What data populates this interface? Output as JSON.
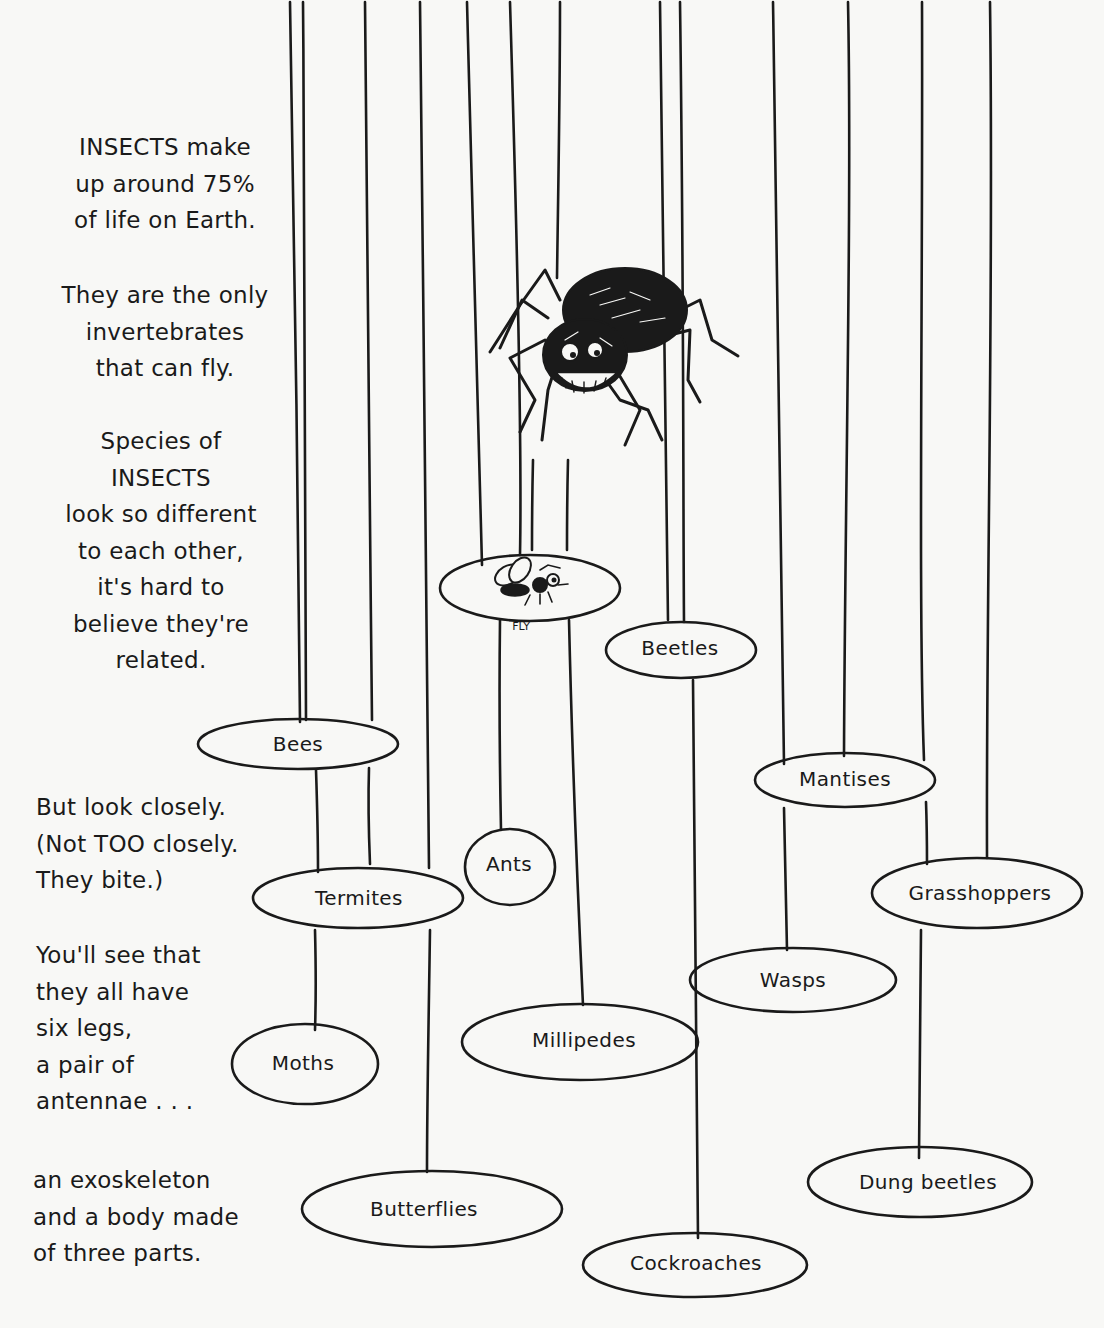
{
  "intro_text": {
    "paragraph_1": "INSECTS make\nup around 75%\nof life on Earth.",
    "paragraph_2": "They are the only\ninvertebrates\nthat can fly.",
    "paragraph_3": "Species of\nINSECTS\nlook so different\nto each other,\nit's hard to\nbelieve they're\nrelated.",
    "paragraph_4": "But look closely.\n(Not TOO closely.\nThey bite.)",
    "paragraph_5": "You'll see that\nthey all have\nsix legs,\na pair of\nantennae . . .",
    "paragraph_6": "an exoskeleton\nand a body made\nof three parts."
  },
  "illustrations": {
    "spider": "spider-illustration",
    "fly": {
      "caption": "FLY"
    }
  },
  "ovals": [
    {
      "label": "Beetles"
    },
    {
      "label": "Bees"
    },
    {
      "label": "Mantises"
    },
    {
      "label": "Ants"
    },
    {
      "label": "Termites"
    },
    {
      "label": "Grasshoppers"
    },
    {
      "label": "Wasps"
    },
    {
      "label": "Millipedes"
    },
    {
      "label": "Moths"
    },
    {
      "label": "Dung beetles"
    },
    {
      "label": "Butterflies"
    },
    {
      "label": "Cockroaches"
    }
  ],
  "colors": {
    "ink": "#1a1a1a",
    "paper": "#f8f8f6"
  }
}
